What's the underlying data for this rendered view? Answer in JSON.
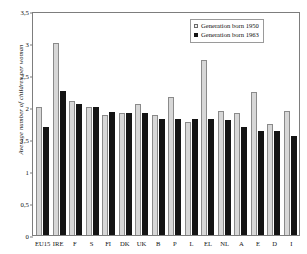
{
  "chart_data": {
    "type": "bar",
    "title": "",
    "xlabel": "",
    "ylabel": "Average number of children per woman",
    "ylim": [
      0,
      3.5
    ],
    "ytick_labels": [
      "3,5",
      "3",
      "2,5",
      "2",
      "1,5",
      "1",
      "0,5",
      "0"
    ],
    "ytick_values": [
      3.5,
      3,
      2.5,
      2,
      1.5,
      1,
      0.5,
      0
    ],
    "grid": false,
    "legend_position": "top-right",
    "categories": [
      "EU15",
      "IRE",
      "F",
      "S",
      "FI",
      "DK",
      "UK",
      "B",
      "P",
      "L",
      "EL",
      "NL",
      "A",
      "E",
      "D",
      "I"
    ],
    "series": [
      {
        "name": "Generation born 1950",
        "color": "#d7d7d7",
        "values": [
          2.0,
          3.0,
          2.09,
          2.0,
          1.87,
          1.91,
          2.05,
          1.88,
          2.15,
          1.77,
          2.73,
          1.93,
          1.9,
          2.23,
          1.73,
          1.94
        ]
      },
      {
        "name": "Generation born 1963",
        "color": "#141414",
        "values": [
          1.69,
          2.25,
          2.04,
          2.0,
          1.92,
          1.91,
          1.9,
          1.82,
          1.81,
          1.81,
          1.81,
          1.79,
          1.68,
          1.63,
          1.62,
          1.55
        ]
      }
    ]
  },
  "legend": {
    "items": [
      {
        "label": "Generation born 1950",
        "marker": "open-square-icon"
      },
      {
        "label": "Generation born 1963",
        "marker": "filled-square-icon"
      }
    ]
  }
}
